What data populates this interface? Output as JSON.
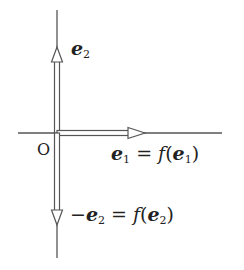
{
  "diagram": {
    "origin_label": "O",
    "labels": {
      "e2": {
        "vec": "e",
        "sub": "2"
      },
      "e1_eq": {
        "vec": "e",
        "sub": "1",
        "eq": " = ",
        "func": "f",
        "arg_vec": "e",
        "arg_sub": "1"
      },
      "neg_e2_eq": {
        "prefix": "−",
        "vec": "e",
        "sub": "2",
        "eq": " = ",
        "func": "f",
        "arg_vec": "e",
        "arg_sub": "2"
      }
    },
    "colors": {
      "line": "#555555",
      "text": "#222222",
      "background": "#ffffff"
    }
  }
}
